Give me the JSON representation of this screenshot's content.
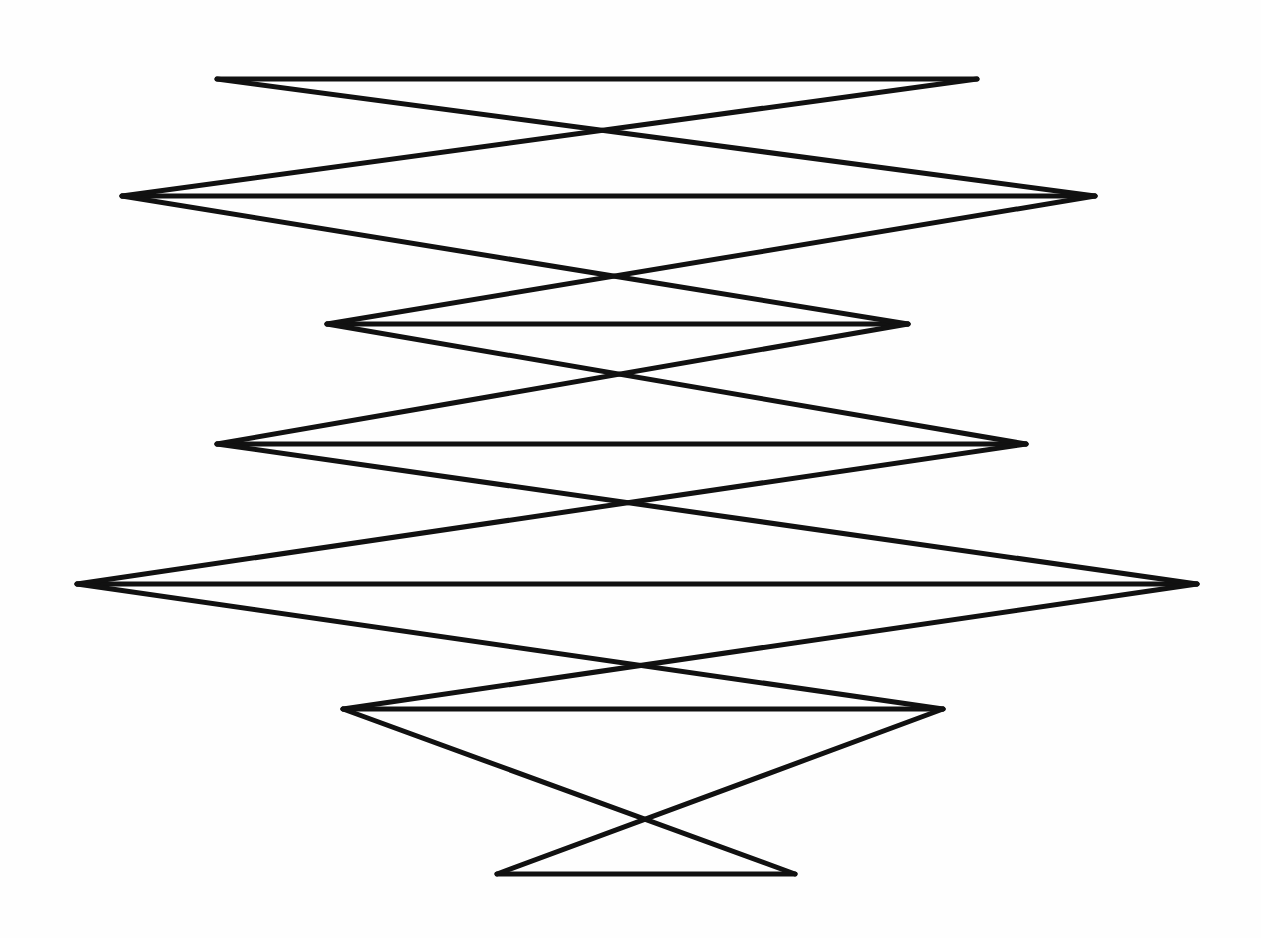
{
  "figure": {
    "width": 1261,
    "height": 938,
    "background": "#fefefe",
    "stroke_color": "#111111",
    "stroke_width": 5,
    "levels": [
      {
        "y": 79,
        "left_x": 217,
        "right_x": 977
      },
      {
        "y": 196,
        "left_x": 122,
        "right_x": 1095
      },
      {
        "y": 324,
        "left_x": 327,
        "right_x": 908
      },
      {
        "y": 444,
        "left_x": 217,
        "right_x": 1026
      },
      {
        "y": 584,
        "left_x": 77,
        "right_x": 1197
      },
      {
        "y": 709,
        "left_x": 343,
        "right_x": 943
      },
      {
        "y": 874,
        "left_x": 497,
        "right_x": 795
      }
    ]
  }
}
